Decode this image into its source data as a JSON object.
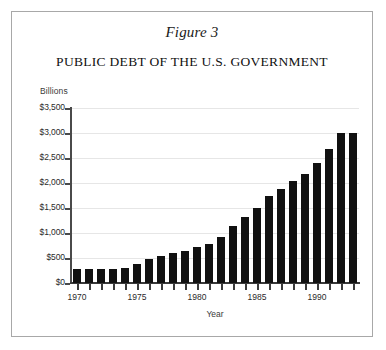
{
  "figure": {
    "label": "Figure 3",
    "title": "PUBLIC DEBT OF THE U.S. GOVERNMENT",
    "border_color": "#a8a8a8",
    "background_color": "#ffffff"
  },
  "chart_data": {
    "type": "bar",
    "title": "PUBLIC DEBT OF THE U.S. GOVERNMENT",
    "subtitle": "Figure 3",
    "xlabel": "Year",
    "ylabel": "Billions",
    "ylim": [
      0,
      3500
    ],
    "ytick_labels": [
      "$3,500",
      "$3,000",
      "$2,500",
      "$2,000",
      "$1,500",
      "$1,000",
      "$500",
      "$0"
    ],
    "ytick_values": [
      3500,
      3000,
      2500,
      2000,
      1500,
      1000,
      500,
      0
    ],
    "ytick_interval": 500,
    "xtick_labels": [
      "1970",
      "1975",
      "1980",
      "1985",
      "1990"
    ],
    "xtick_values": [
      1970,
      1975,
      1980,
      1985,
      1990
    ],
    "xlim": [
      1969.5,
      1993.5
    ],
    "grid": true,
    "grid_axis": "y",
    "grid_color": "#e6e6e6",
    "legend": false,
    "bar_color": "#111111",
    "categories": [
      1970,
      1971,
      1972,
      1973,
      1974,
      1975,
      1976,
      1977,
      1978,
      1979,
      1980,
      1981,
      1982,
      1983,
      1984,
      1985,
      1986,
      1987,
      1988,
      1989,
      1990,
      1991,
      1992,
      1993
    ],
    "values": [
      283,
      276,
      275,
      286,
      300,
      376,
      477,
      549,
      607,
      640,
      712,
      789,
      925,
      1137,
      1312,
      1500,
      1736,
      1888,
      2050,
      2190,
      2410,
      2690,
      2999,
      3000
    ],
    "units": "billions of dollars",
    "points": [
      {
        "x": 1970,
        "y": 283
      },
      {
        "x": 1971,
        "y": 276
      },
      {
        "x": 1972,
        "y": 275
      },
      {
        "x": 1973,
        "y": 286
      },
      {
        "x": 1974,
        "y": 300
      },
      {
        "x": 1975,
        "y": 376
      },
      {
        "x": 1976,
        "y": 477
      },
      {
        "x": 1977,
        "y": 549
      },
      {
        "x": 1978,
        "y": 607
      },
      {
        "x": 1979,
        "y": 640
      },
      {
        "x": 1980,
        "y": 712
      },
      {
        "x": 1981,
        "y": 789
      },
      {
        "x": 1982,
        "y": 925
      },
      {
        "x": 1983,
        "y": 1137
      },
      {
        "x": 1984,
        "y": 1312
      },
      {
        "x": 1985,
        "y": 1500
      },
      {
        "x": 1986,
        "y": 1736
      },
      {
        "x": 1987,
        "y": 1888
      },
      {
        "x": 1988,
        "y": 2050
      },
      {
        "x": 1989,
        "y": 2190
      },
      {
        "x": 1990,
        "y": 2410
      },
      {
        "x": 1991,
        "y": 2690
      },
      {
        "x": 1992,
        "y": 2999
      },
      {
        "x": 1993,
        "y": 3000
      }
    ]
  }
}
